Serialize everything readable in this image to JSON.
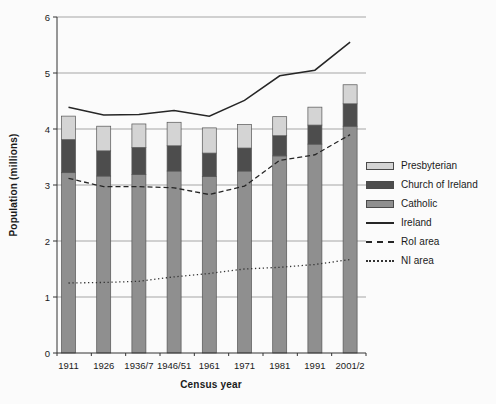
{
  "figure": {
    "background_color": "#fbfbfb",
    "text_color": "#1a1a1a",
    "gridline_color": "#9b9b9b",
    "axis_color": "#333333"
  },
  "chart_data": {
    "type": "bar",
    "subtype": "stacked-bar-with-lines",
    "title": "",
    "xlabel": "Census year",
    "ylabel": "Population (millions)",
    "ylim": [
      0,
      6
    ],
    "yticks": [
      0,
      1,
      2,
      3,
      4,
      5,
      6
    ],
    "grid": "horizontal",
    "legend_position": "right",
    "categories": [
      "1911",
      "1926",
      "1936/7",
      "1946/51",
      "1961",
      "1971",
      "1981",
      "1991",
      "2001/2"
    ],
    "bar_series": [
      {
        "name": "Catholic",
        "color": "#8f8f8f",
        "values": [
          3.22,
          3.16,
          3.19,
          3.25,
          3.15,
          3.25,
          3.52,
          3.73,
          4.05
        ]
      },
      {
        "name": "Church of Ireland",
        "color": "#4d4d4d",
        "values": [
          0.59,
          0.45,
          0.48,
          0.45,
          0.42,
          0.41,
          0.36,
          0.34,
          0.4
        ]
      },
      {
        "name": "Presbyterian",
        "color": "#d4d4d4",
        "values": [
          0.42,
          0.44,
          0.42,
          0.42,
          0.45,
          0.42,
          0.34,
          0.32,
          0.34
        ]
      }
    ],
    "line_series": [
      {
        "name": "Ireland",
        "style": "solid",
        "color": "#262626",
        "values": [
          4.39,
          4.25,
          4.26,
          4.33,
          4.23,
          4.51,
          4.95,
          5.05,
          5.55
        ]
      },
      {
        "name": "RoI area",
        "style": "dashed",
        "color": "#262626",
        "values": [
          3.12,
          2.97,
          2.97,
          2.95,
          2.83,
          2.98,
          3.44,
          3.54,
          3.9
        ]
      },
      {
        "name": "NI area",
        "style": "dotted",
        "color": "#333333",
        "values": [
          1.25,
          1.26,
          1.28,
          1.36,
          1.42,
          1.5,
          1.53,
          1.58,
          1.67
        ]
      }
    ],
    "legend_items": [
      {
        "label": "Presbyterian",
        "swatch": "box",
        "color": "#d4d4d4"
      },
      {
        "label": "Church of Ireland",
        "swatch": "box",
        "color": "#4d4d4d"
      },
      {
        "label": "Catholic",
        "swatch": "box",
        "color": "#8f8f8f"
      },
      {
        "label": "Ireland",
        "swatch": "line-solid",
        "color": "#262626"
      },
      {
        "label": "RoI area",
        "swatch": "line-dashed",
        "color": "#262626"
      },
      {
        "label": "NI area",
        "swatch": "line-dotted",
        "color": "#333333"
      }
    ]
  }
}
